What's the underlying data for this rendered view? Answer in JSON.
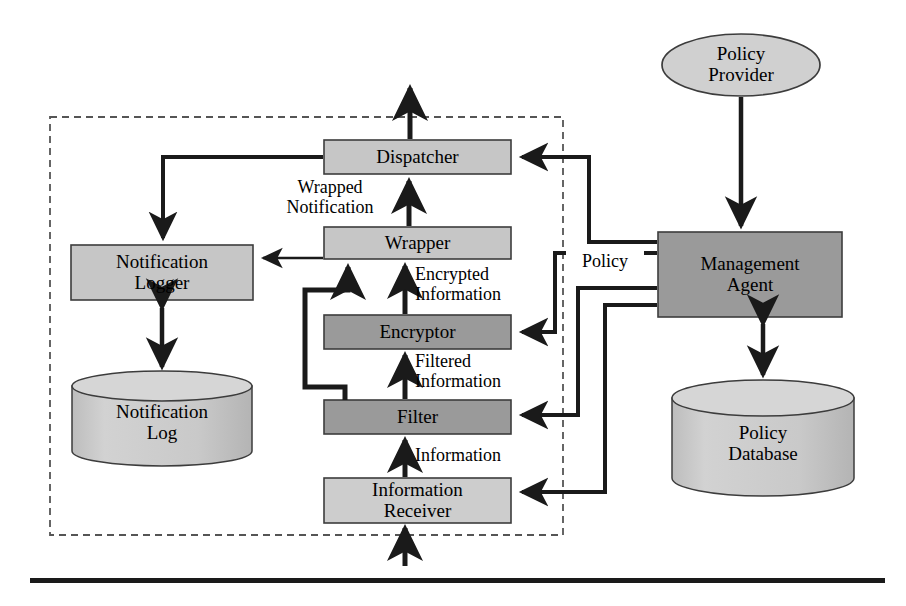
{
  "figure": {
    "colors": {
      "light_gray": "#d4d4d4",
      "mid_gray": "#c6c6c6",
      "dark_gray": "#9a9a9a",
      "stroke": "#3c3c3c",
      "arrow": "#1a1a1a",
      "text": "#000000",
      "background": "#ffffff",
      "dashed_border": "#555555",
      "rule": "#1a1a1a"
    }
  },
  "boundary": {
    "name": "trusted-domain-boundary",
    "style": "dashed",
    "x": 50,
    "y": 117,
    "width": 513,
    "height": 418
  },
  "nodes": [
    {
      "id": "dispatcher",
      "label": "Dispatcher",
      "shape": "rect",
      "fill": "mid_gray",
      "x": 324,
      "y": 140,
      "width": 187,
      "height": 34,
      "font_size": 19
    },
    {
      "id": "wrapper",
      "label": "Wrapper",
      "shape": "rect",
      "fill": "mid_gray",
      "x": 324,
      "y": 227,
      "width": 187,
      "height": 32,
      "font_size": 19
    },
    {
      "id": "encryptor",
      "label": "Encryptor",
      "shape": "rect",
      "fill": "dark_gray",
      "x": 324,
      "y": 315,
      "width": 187,
      "height": 34,
      "font_size": 19
    },
    {
      "id": "filter",
      "label": "Filter",
      "shape": "rect",
      "fill": "dark_gray",
      "x": 324,
      "y": 400,
      "width": 187,
      "height": 34,
      "font_size": 19
    },
    {
      "id": "information-receiver",
      "label": "Information\nReceiver",
      "shape": "rect",
      "fill": "mid_gray",
      "x": 324,
      "y": 478,
      "width": 187,
      "height": 45,
      "font_size": 19
    },
    {
      "id": "notification-logger",
      "label": "Notification\nLogger",
      "shape": "rect",
      "fill": "mid_gray",
      "x": 71,
      "y": 245,
      "width": 182,
      "height": 55,
      "font_size": 19
    },
    {
      "id": "notification-log",
      "label": "Notification\nLog",
      "shape": "cylinder",
      "fill": "mid_gray",
      "x": 72,
      "y": 372,
      "width": 180,
      "height": 93,
      "font_size": 19
    },
    {
      "id": "management-agent",
      "label": "Management\nAgent",
      "shape": "rect",
      "fill": "dark_gray",
      "x": 658,
      "y": 232,
      "width": 184,
      "height": 85,
      "font_size": 19
    },
    {
      "id": "policy-provider",
      "label": "Policy\nProvider",
      "shape": "ellipse",
      "fill": "mid_gray",
      "x": 662,
      "y": 34,
      "width": 158,
      "height": 62,
      "font_size": 19
    },
    {
      "id": "policy-database",
      "label": "Policy\nDatabase",
      "shape": "cylinder",
      "fill": "mid_gray",
      "x": 672,
      "y": 380,
      "width": 182,
      "height": 116,
      "font_size": 19
    }
  ],
  "edge_labels": [
    {
      "id": "wrapped-notification",
      "text": "Wrapped\nNotification",
      "x": 255,
      "y": 178,
      "width": 150,
      "font_size": 18,
      "align": "center"
    },
    {
      "id": "encrypted-information",
      "text": "Encrypted\nInformation",
      "x": 415,
      "y": 265,
      "width": 190,
      "font_size": 18,
      "align": "left"
    },
    {
      "id": "filtered-information",
      "text": "Filtered\nInformation",
      "x": 415,
      "y": 352,
      "width": 190,
      "font_size": 18,
      "align": "left"
    },
    {
      "id": "information",
      "text": "Information",
      "x": 415,
      "y": 446,
      "width": 190,
      "font_size": 18,
      "align": "left"
    },
    {
      "id": "policy",
      "text": "Policy",
      "x": 582,
      "y": 261,
      "width": 80,
      "font_size": 18,
      "align": "center"
    }
  ],
  "flows": [
    {
      "id": "flow-receiver-to-filter",
      "from": "information-receiver",
      "to": "filter",
      "label": "Information"
    },
    {
      "id": "flow-filter-to-encryptor",
      "from": "filter",
      "to": "encryptor",
      "label": "Filtered Information"
    },
    {
      "id": "flow-encryptor-to-wrapper",
      "from": "encryptor",
      "to": "wrapper",
      "label": "Encrypted Information"
    },
    {
      "id": "flow-filter-bypass-to-wrapper",
      "from": "filter",
      "to": "wrapper",
      "label": ""
    },
    {
      "id": "flow-wrapper-to-dispatcher",
      "from": "wrapper",
      "to": "dispatcher",
      "label": ""
    },
    {
      "id": "flow-wrapper-to-logger",
      "from": "wrapper",
      "to": "notification-logger",
      "label": ""
    },
    {
      "id": "flow-dispatcher-to-logger",
      "from": "dispatcher",
      "to": "notification-logger",
      "label": "Wrapped Notification"
    },
    {
      "id": "flow-dispatcher-out",
      "from": "dispatcher",
      "to": "external",
      "label": ""
    },
    {
      "id": "flow-external-in",
      "from": "external",
      "to": "information-receiver",
      "label": ""
    },
    {
      "id": "flow-logger-log-bidirectional",
      "from": "notification-logger",
      "to": "notification-log",
      "label": ""
    },
    {
      "id": "flow-provider-to-agent",
      "from": "policy-provider",
      "to": "management-agent",
      "label": ""
    },
    {
      "id": "flow-agent-db-bidirectional",
      "from": "management-agent",
      "to": "policy-database",
      "label": ""
    },
    {
      "id": "flow-agent-to-dispatcher",
      "from": "management-agent",
      "to": "dispatcher",
      "label": ""
    },
    {
      "id": "flow-agent-to-encryptor",
      "from": "management-agent",
      "to": "encryptor",
      "label": "Policy"
    },
    {
      "id": "flow-agent-to-filter",
      "from": "management-agent",
      "to": "filter",
      "label": "Policy"
    },
    {
      "id": "flow-agent-to-receiver",
      "from": "management-agent",
      "to": "information-receiver",
      "label": "Policy"
    }
  ],
  "footer_rule": {
    "id": "bottom-rule",
    "x": 30,
    "y": 578,
    "width": 855,
    "height": 5
  }
}
